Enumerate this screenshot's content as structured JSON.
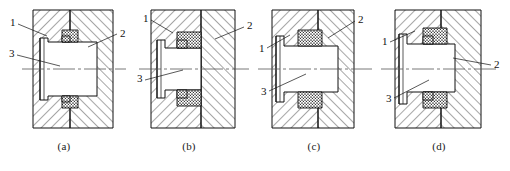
{
  "figure": {
    "type": "engineering-section-drawing",
    "panel_count": 4,
    "callout_legend": {
      "1": "housing / bore locating face (part 1)",
      "2": "housing body (part 2)",
      "3": "bushing / sleeve (part 3)"
    },
    "colors": {
      "line": "#111111",
      "hatch": "#222222",
      "seal_fill": "#3a3a3a",
      "body_fill": "#ffffff",
      "centerline": "#555555"
    },
    "panels": [
      {
        "id": "a",
        "caption": "(a)",
        "labels": [
          {
            "text": "1",
            "x": 10,
            "y": 26,
            "lx1": 18,
            "ly1": 24,
            "lx2": 47,
            "ly2": 36
          },
          {
            "text": "2",
            "x": 120,
            "y": 37,
            "lx1": 117,
            "ly1": 34,
            "lx2": 88,
            "ly2": 47
          },
          {
            "text": "3",
            "x": 9,
            "y": 57,
            "lx1": 17,
            "ly1": 55,
            "lx2": 60,
            "ly2": 66
          }
        ]
      },
      {
        "id": "b",
        "caption": "(b)",
        "labels": [
          {
            "text": "1",
            "x": 18,
            "y": 22,
            "lx1": 26,
            "ly1": 20,
            "lx2": 48,
            "ly2": 33
          },
          {
            "text": "2",
            "x": 122,
            "y": 29,
            "lx1": 119,
            "ly1": 27,
            "lx2": 90,
            "ly2": 39
          },
          {
            "text": "3",
            "x": 12,
            "y": 82,
            "lx1": 20,
            "ly1": 80,
            "lx2": 58,
            "ly2": 70
          }
        ]
      },
      {
        "id": "c",
        "caption": "(c)",
        "labels": [
          {
            "text": "1",
            "x": 9,
            "y": 52,
            "lx1": 17,
            "ly1": 48,
            "lx2": 40,
            "ly2": 35
          },
          {
            "text": "2",
            "x": 108,
            "y": 23,
            "lx1": 105,
            "ly1": 21,
            "lx2": 78,
            "ly2": 38
          },
          {
            "text": "3",
            "x": 11,
            "y": 95,
            "lx1": 19,
            "ly1": 91,
            "lx2": 56,
            "ly2": 74
          }
        ]
      },
      {
        "id": "d",
        "caption": "(d)",
        "labels": [
          {
            "text": "1",
            "x": 7,
            "y": 45,
            "lx1": 15,
            "ly1": 42,
            "lx2": 40,
            "ly2": 31
          },
          {
            "text": "2",
            "x": 119,
            "y": 68,
            "lx1": 116,
            "ly1": 65,
            "lx2": 78,
            "ly2": 58
          },
          {
            "text": "3",
            "x": 11,
            "y": 102,
            "lx1": 19,
            "ly1": 98,
            "lx2": 54,
            "ly2": 80
          }
        ]
      }
    ]
  }
}
